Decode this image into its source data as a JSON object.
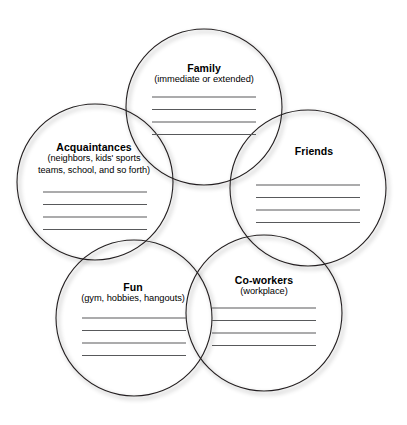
{
  "worksheet": {
    "type": "five-circle-overlapping-venn-worksheet",
    "background_color": "#ffffff",
    "outline_color": "#231f20",
    "rule_line_color": "#58595b",
    "text_color": "#000000",
    "circles": [
      {
        "id": "family",
        "title": "Family",
        "subtitle": "(immediate or extended)",
        "position": "top-center",
        "cx": 204,
        "cy": 107,
        "r": 78,
        "write_lines": 4
      },
      {
        "id": "acquaintances",
        "title": "Acquaintances",
        "subtitle": "(neighbors, kids' sports teams, school, and so forth)",
        "subtitle_line_1": "(neighbors, kids' sports",
        "subtitle_line_2": "teams, school, and so forth)",
        "position": "upper-left",
        "cx": 95,
        "cy": 182,
        "r": 78,
        "write_lines": 4
      },
      {
        "id": "friends",
        "title": "Friends",
        "subtitle": "",
        "position": "right",
        "cx": 308,
        "cy": 188,
        "r": 78,
        "write_lines": 4
      },
      {
        "id": "fun",
        "title": "Fun",
        "subtitle": "(gym, hobbies, hangouts)",
        "position": "bottom-left",
        "cx": 134,
        "cy": 318,
        "r": 78,
        "write_lines": 4
      },
      {
        "id": "coworkers",
        "title": "Co-workers",
        "subtitle": "(workplace)",
        "position": "bottom-right",
        "cx": 264,
        "cy": 313,
        "r": 78,
        "write_lines": 4
      }
    ]
  }
}
